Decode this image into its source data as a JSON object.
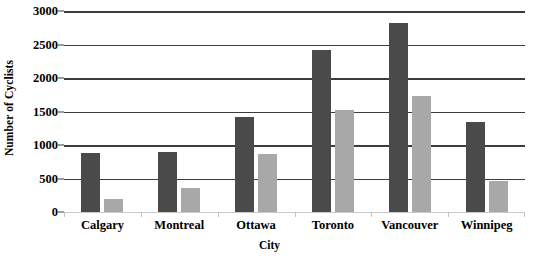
{
  "chart_data": {
    "type": "bar",
    "title": "",
    "xlabel": "City",
    "ylabel": "Number of Cyclists",
    "categories": [
      "Calgary",
      "Montreal",
      "Ottawa",
      "Toronto",
      "Vancouver",
      "Winnipeg"
    ],
    "series": [
      {
        "name": "Series 1",
        "color": "#4a4a4a",
        "values": [
          880,
          900,
          1420,
          2420,
          2820,
          1340
        ]
      },
      {
        "name": "Series 2",
        "color": "#a8a8a8",
        "values": [
          190,
          360,
          870,
          1530,
          1730,
          460
        ]
      }
    ],
    "ylim": [
      0,
      3000
    ],
    "yticks": [
      0,
      500,
      1000,
      1500,
      2000,
      2500,
      3000
    ],
    "ytick_labels": [
      "0",
      "500",
      "1000",
      "1500",
      "2000",
      "2500",
      "3000"
    ],
    "grid": true,
    "grid_axis": "y",
    "legend": false,
    "legend_position": "none",
    "background_color": "#ffffff",
    "gridline_color": "#3c3c3c",
    "baseline_color": "#c9c9c9"
  }
}
